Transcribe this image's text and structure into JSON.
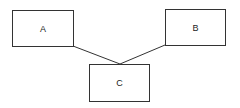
{
  "diagram": {
    "nodes": [
      {
        "id": "A",
        "label": "A",
        "x": 12,
        "y": 10,
        "w": 62,
        "h": 37
      },
      {
        "id": "B",
        "label": "B",
        "x": 165,
        "y": 9,
        "w": 61,
        "h": 37
      },
      {
        "id": "C",
        "label": "C",
        "x": 89,
        "y": 64,
        "w": 61,
        "h": 38
      }
    ],
    "edges": [
      {
        "from": "A",
        "to": "C"
      },
      {
        "from": "B",
        "to": "C"
      }
    ],
    "colors": {
      "stroke": "#333333",
      "background": "#ffffff"
    }
  }
}
